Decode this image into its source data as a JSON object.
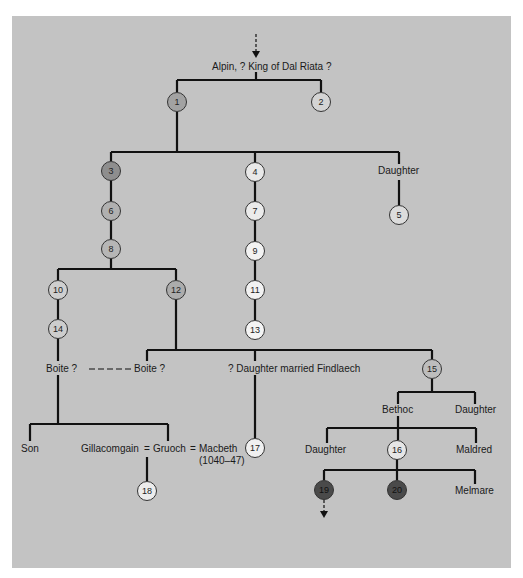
{
  "diagram": {
    "type": "family-tree",
    "root_label": "Alpin, ? King of Dal Riata ?",
    "nodes": [
      {
        "id": "1",
        "label": "1",
        "fill": "#a2a2a2"
      },
      {
        "id": "2",
        "label": "2",
        "fill": "#d4d4d4"
      },
      {
        "id": "3",
        "label": "3",
        "fill": "#8e8e8e"
      },
      {
        "id": "4",
        "label": "4",
        "fill": "#e8e8e8"
      },
      {
        "id": "5",
        "label": "5",
        "fill": "#dcdcdc"
      },
      {
        "id": "6",
        "label": "6",
        "fill": "#b0b0b0"
      },
      {
        "id": "7",
        "label": "7",
        "fill": "#ebebeb"
      },
      {
        "id": "8",
        "label": "8",
        "fill": "#b6b6b6"
      },
      {
        "id": "9",
        "label": "9",
        "fill": "#f2f2f2"
      },
      {
        "id": "10",
        "label": "10",
        "fill": "#cfcfcf"
      },
      {
        "id": "11",
        "label": "11",
        "fill": "#f2f2f2"
      },
      {
        "id": "12",
        "label": "12",
        "fill": "#acacac"
      },
      {
        "id": "13",
        "label": "13",
        "fill": "#f4f4f4"
      },
      {
        "id": "14",
        "label": "14",
        "fill": "#cdcdcd"
      },
      {
        "id": "15",
        "label": "15",
        "fill": "#bdbdbd"
      },
      {
        "id": "16",
        "label": "16",
        "fill": "#e6e6e6"
      },
      {
        "id": "17",
        "label": "17",
        "fill": "#f0f0f0"
      },
      {
        "id": "18",
        "label": "18",
        "fill": "#ececec"
      },
      {
        "id": "19",
        "label": "19",
        "fill": "#4a4a4a"
      },
      {
        "id": "20",
        "label": "20",
        "fill": "#4a4a4a"
      }
    ],
    "labels": {
      "daughter_top": "Daughter",
      "boite_left": "Boite ?",
      "boite_right": "Boite ?",
      "daughter_findlaech": "? Daughter married Findlaech",
      "bethoc": "Bethoc",
      "daughter_15": "Daughter",
      "son": "Son",
      "gillacomgain": "Gillacomgain",
      "eq1": "=",
      "gruoch": "Gruoch",
      "eq2": "=",
      "macbeth": "Macbeth",
      "macbeth_reign": "(1040–47)",
      "daughter_bethoc": "Daughter",
      "maldred": "Maldred",
      "melmare": "Melmare"
    },
    "colors": {
      "background": "#c3c3c3",
      "line": "#111111"
    }
  }
}
